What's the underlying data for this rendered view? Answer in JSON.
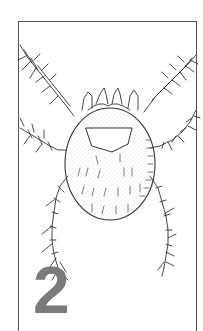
{
  "figure": {
    "number": "2",
    "colors": {
      "line": "#333333",
      "number": "#7a7a7a",
      "frame": "#555555",
      "background": "#ffffff"
    }
  }
}
